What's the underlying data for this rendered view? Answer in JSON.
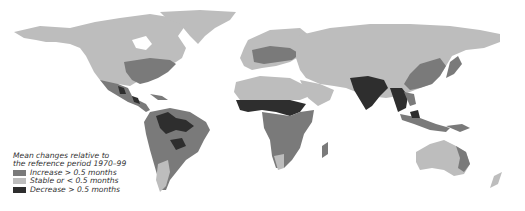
{
  "map": {
    "type": "choropleth-world",
    "colors": {
      "increase": "#7a7a7a",
      "stable": "#bdbdbd",
      "decrease": "#2e2e2e",
      "ocean": "#ffffff"
    }
  },
  "legend": {
    "title_line1": "Mean changes relative to",
    "title_line2": "the reference period 1970–99",
    "items": [
      {
        "label": "Increase > 0.5 months",
        "color": "#7a7a7a"
      },
      {
        "label": "Stable or < 0.5 months",
        "color": "#bdbdbd"
      },
      {
        "label": "Decrease > 0.5 months",
        "color": "#2e2e2e"
      }
    ]
  }
}
